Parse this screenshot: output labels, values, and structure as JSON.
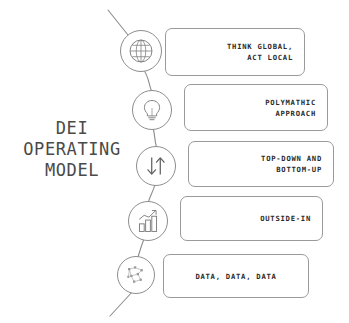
{
  "diagram": {
    "title": "DEI\nOPERATING\nMODEL",
    "line_color": "#8d8d8d",
    "card_border_color": "#9a9a9a",
    "text_color": "#2b2b2b",
    "title_color": "#4a4a4a",
    "background": "#ffffff",
    "nodes": [
      {
        "icon": "globe-icon",
        "label": "THINK GLOBAL,\nACT LOCAL",
        "align": "right"
      },
      {
        "icon": "lightbulb-icon",
        "label": "POLYMATHIC\nAPPROACH",
        "align": "right"
      },
      {
        "icon": "up-down-arrows-icon",
        "label": "TOP-DOWN AND\nBOTTOM-UP",
        "align": "right"
      },
      {
        "icon": "bar-chart-growth-icon",
        "label": "OUTSIDE-IN",
        "align": "right"
      },
      {
        "icon": "data-network-icon",
        "label": "DATA, DATA, DATA",
        "align": "center"
      }
    ]
  }
}
